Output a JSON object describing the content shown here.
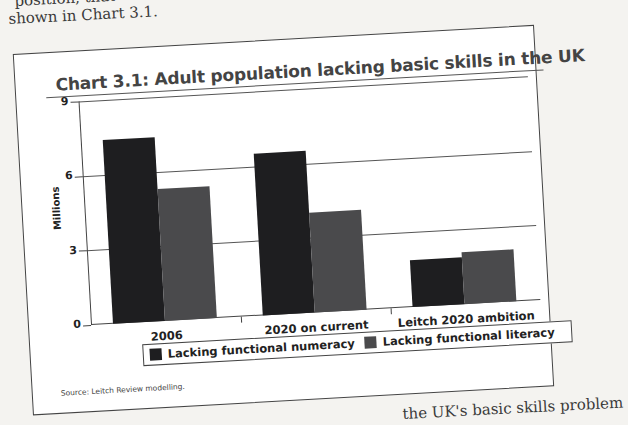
{
  "page": {
    "top_text_line1": "position, that",
    "top_text_line2": "shown in Chart 3.1.",
    "bottom_text": "the UK's basic skills problem"
  },
  "colors": {
    "numeracy": "#1e1e20",
    "literacy": "#4a4a4c"
  },
  "chart_data": {
    "type": "bar",
    "title": "Chart 3.1: Adult population lacking basic skills in the UK",
    "xlabel": "",
    "ylabel": "Millions",
    "ylim": [
      0,
      9
    ],
    "yticks": [
      "0",
      "3",
      "6",
      "9"
    ],
    "grid": true,
    "legend_position": "bottom",
    "categories": [
      "2006",
      "2020 on current ambitions",
      "Leitch 2020 ambition"
    ],
    "series": [
      {
        "name": "Lacking functional numeracy",
        "values": [
          7.4,
          6.5,
          1.9
        ]
      },
      {
        "name": "Lacking functional literacy",
        "values": [
          5.3,
          4.0,
          2.1
        ]
      }
    ],
    "source": "Source: Leitch Review modelling."
  }
}
